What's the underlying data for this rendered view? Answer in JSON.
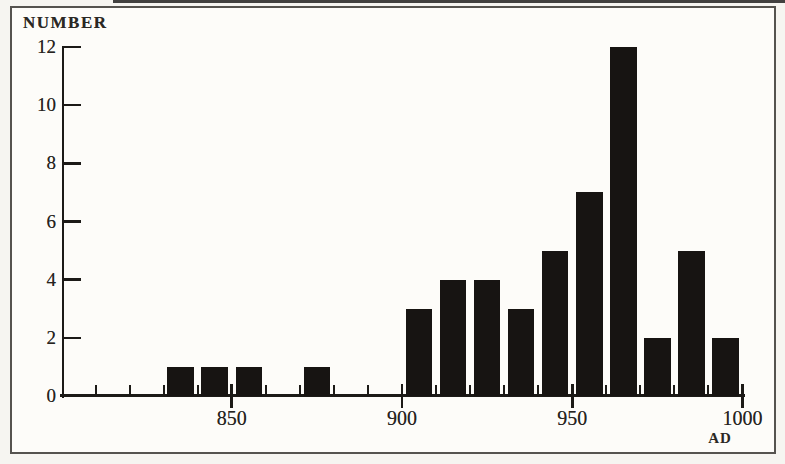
{
  "colors": {
    "bar": "#171412",
    "axis": "#1c1a17",
    "frame": "#55534f",
    "text": "#262320"
  },
  "chart_data": {
    "type": "bar",
    "title": "",
    "ylabel": "NUMBER",
    "xlabel": "AD",
    "x_range": [
      800,
      1000
    ],
    "ylim": [
      0,
      12
    ],
    "yticks": [
      0,
      2,
      4,
      6,
      8,
      10,
      12
    ],
    "xticks_major": [
      850,
      900,
      950,
      1000
    ],
    "xtick_minor_step": 10,
    "bin_width_years": 10,
    "bin_centers": [
      835,
      845,
      855,
      875,
      905,
      915,
      925,
      935,
      945,
      955,
      965,
      975,
      985,
      995
    ],
    "values": [
      1,
      1,
      1,
      1,
      3,
      4,
      4,
      3,
      5,
      7,
      12,
      2,
      5,
      2
    ],
    "grid": false,
    "legend": null
  }
}
